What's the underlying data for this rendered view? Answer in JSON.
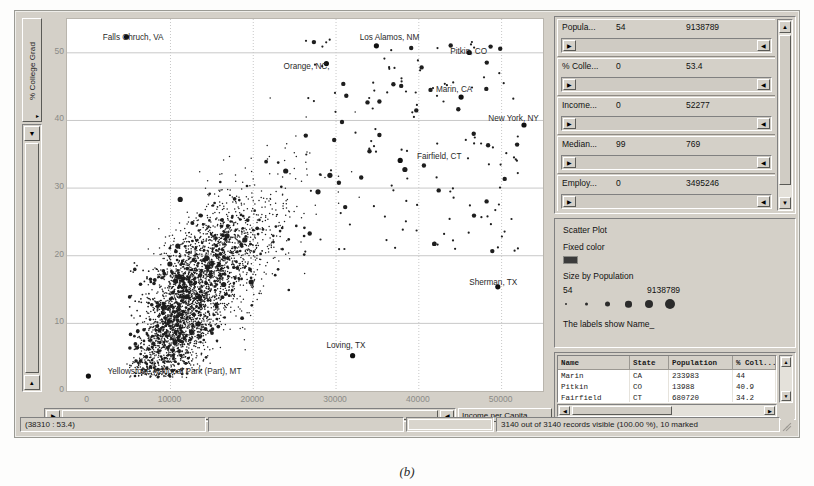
{
  "window": {
    "caption": "(b)"
  },
  "plot": {
    "y_axis": {
      "label": "% College Grad",
      "ticks": [
        "0",
        "10",
        "20",
        "30",
        "40",
        "50"
      ],
      "min": 0,
      "max": 55
    },
    "x_axis": {
      "label": "Income per Capita",
      "ticks": [
        "0",
        "10000",
        "20000",
        "30000",
        "40000",
        "50000"
      ],
      "min": -2500,
      "max": 55000
    },
    "point_labels": [
      {
        "text": "Falls Chruch, VA",
        "x": 0.075,
        "y": 0.055
      },
      {
        "text": "Los Alamos, NM",
        "x": 0.615,
        "y": 0.055
      },
      {
        "text": "Pitkin, CO",
        "x": 0.805,
        "y": 0.095
      },
      {
        "text": "Orange, NC,",
        "x": 0.455,
        "y": 0.135
      },
      {
        "text": "Marin, CA",
        "x": 0.775,
        "y": 0.195
      },
      {
        "text": "New York, NY",
        "x": 0.885,
        "y": 0.275
      },
      {
        "text": "Fairfield, CT",
        "x": 0.735,
        "y": 0.375
      },
      {
        "text": "Sherman, TX",
        "x": 0.845,
        "y": 0.715
      },
      {
        "text": "Loving, TX",
        "x": 0.545,
        "y": 0.885
      },
      {
        "text": "Yellowstone National Park (Part), MT",
        "x": 0.085,
        "y": 0.955
      }
    ]
  },
  "filters": {
    "rows": [
      {
        "name": "Popula...",
        "min": "54",
        "max": "9138789"
      },
      {
        "name": "% Colle...",
        "min": "0",
        "max": "53.4"
      },
      {
        "name": "Income...",
        "min": "0",
        "max": "52277"
      },
      {
        "name": "Median...",
        "min": "99",
        "max": "769"
      },
      {
        "name": "Employ...",
        "min": "0",
        "max": "3495246"
      }
    ],
    "scroll_up_icon": "▲",
    "scroll_down_icon": "▼",
    "handle_left_icon": "▶",
    "handle_right_icon": "◀"
  },
  "legend": {
    "title": "Scatter Plot",
    "color_mode": "Fixed color",
    "color_hex": "#3b3b3b",
    "size_by": "Size by Population",
    "size_min": "54",
    "size_max": "9138789",
    "label_note": "The labels show Name_",
    "dot_sizes": [
      2,
      3,
      5,
      6.5,
      8,
      10
    ]
  },
  "table": {
    "columns": [
      "Name",
      "State",
      "Population",
      "% Coll..."
    ],
    "rows": [
      [
        "Marin",
        "CA",
        "233983",
        "44"
      ],
      [
        "Pitkin",
        "CO",
        "13988",
        "40.9"
      ],
      [
        "Fairfield",
        "CT",
        "680720",
        "34.2"
      ]
    ],
    "scroll_up_icon": "▲",
    "scroll_down_icon": "▼",
    "scroll_left_icon": "◀",
    "scroll_right_icon": "▶"
  },
  "status": {
    "coordinates": "(38310 : 53.4)",
    "records": "3140 out of 3140 records visible (100.00 %), 10 marked"
  },
  "icons": {
    "caret_down": "▼",
    "caret_up": "▲",
    "caret_left": "◀",
    "caret_right": "▶",
    "triangle_small_right": "▸",
    "triangle_small_up": "▴"
  }
}
